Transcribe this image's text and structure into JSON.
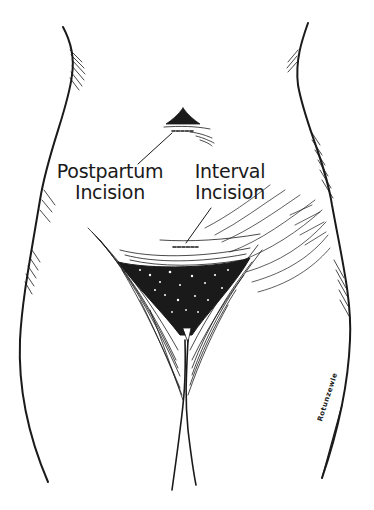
{
  "figure": {
    "labels": {
      "postpartum": {
        "line1": "Postpartum",
        "line2": "Incision"
      },
      "interval": {
        "line1": "Interval",
        "line2": "Incision"
      }
    },
    "signature": "Rotunzewle",
    "colors": {
      "ink": "#1a1a1a",
      "background": "#ffffff"
    }
  }
}
